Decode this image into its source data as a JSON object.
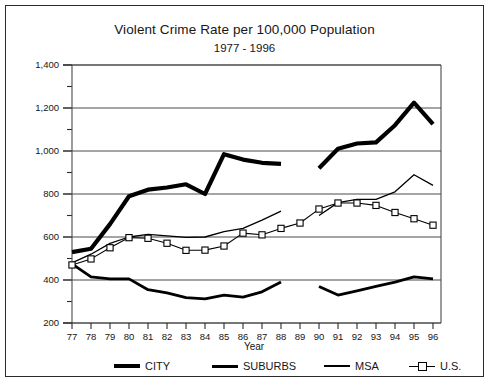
{
  "chart_data": {
    "type": "line",
    "title": "Violent Crime Rate per 100,000 Population",
    "subtitle": "1977 - 1996",
    "xlabel": "Year",
    "ylabel": "",
    "xlim": [
      1977,
      1996
    ],
    "ylim": [
      200,
      1400
    ],
    "ytick_step": 200,
    "yminor_step": 100,
    "grid": "horizontal",
    "legend_position": "bottom",
    "categories": [
      "77",
      "78",
      "79",
      "80",
      "81",
      "82",
      "83",
      "84",
      "85",
      "86",
      "87",
      "88",
      "89",
      "90",
      "91",
      "92",
      "93",
      "94",
      "95",
      "96"
    ],
    "x": [
      1977,
      1978,
      1979,
      1980,
      1981,
      1982,
      1983,
      1984,
      1985,
      1986,
      1987,
      1988,
      1989,
      1990,
      1991,
      1992,
      1993,
      1994,
      1995,
      1996
    ],
    "ytick_labels": [
      "200",
      "400",
      "600",
      "800",
      "1,000",
      "1,200",
      "1,400"
    ],
    "ytick_values": [
      200,
      400,
      600,
      800,
      1000,
      1200,
      1400
    ],
    "series": [
      {
        "name": "CITY",
        "style": "thick-solid",
        "color": "#000000",
        "values": [
          530,
          545,
          660,
          790,
          820,
          830,
          845,
          800,
          985,
          960,
          945,
          940,
          null,
          920,
          1010,
          1035,
          1040,
          1120,
          1225,
          1125
        ]
      },
      {
        "name": "SUBURBS",
        "style": "medium-solid",
        "color": "#000000",
        "values": [
          475,
          415,
          405,
          405,
          355,
          340,
          318,
          312,
          330,
          320,
          345,
          390,
          null,
          370,
          330,
          350,
          370,
          390,
          415,
          405
        ]
      },
      {
        "name": "MSA",
        "style": "thin-solid",
        "color": "#000000",
        "values": [
          480,
          520,
          570,
          600,
          612,
          605,
          598,
          600,
          625,
          640,
          678,
          720,
          null,
          700,
          760,
          775,
          775,
          810,
          890,
          840
        ]
      },
      {
        "name": "U.S.",
        "style": "thin-square-marker",
        "color": "#000000",
        "values": [
          470,
          498,
          550,
          597,
          594,
          571,
          538,
          539,
          558,
          618,
          610,
          640,
          665,
          730,
          758,
          758,
          747,
          714,
          685,
          655
        ]
      }
    ]
  },
  "legend": {
    "entries": [
      {
        "label": "CITY",
        "key": "city"
      },
      {
        "label": "SUBURBS",
        "key": "suburbs"
      },
      {
        "label": "MSA",
        "key": "msa"
      },
      {
        "label": "U.S.",
        "key": "us"
      }
    ]
  }
}
